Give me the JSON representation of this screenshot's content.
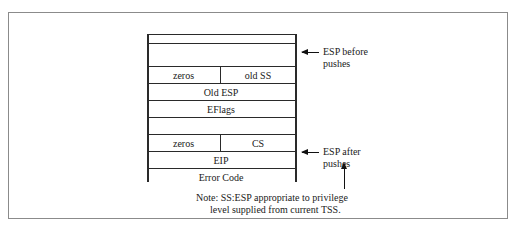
{
  "figure": {
    "type": "stack-layout-diagram",
    "top_caption_sliver": "",
    "stack": {
      "rows": [
        {
          "id": "row-empty-top",
          "cells": [
            {
              "label": ""
            }
          ]
        },
        {
          "id": "row-ss",
          "cells": [
            {
              "label": "zeros"
            },
            {
              "label": "old SS"
            }
          ]
        },
        {
          "id": "row-old-esp",
          "cells": [
            {
              "label": "Old ESP"
            }
          ]
        },
        {
          "id": "row-eflags",
          "cells": [
            {
              "label": "EFlags"
            }
          ]
        },
        {
          "id": "row-cs",
          "cells": [
            {
              "label": "zeros"
            },
            {
              "label": "CS"
            }
          ]
        },
        {
          "id": "row-eip",
          "cells": [
            {
              "label": "EIP"
            }
          ]
        },
        {
          "id": "row-error-code",
          "cells": [
            {
              "label": "Error Code"
            }
          ]
        },
        {
          "id": "row-empty-bottom",
          "cells": [
            {
              "label": ""
            }
          ]
        }
      ]
    },
    "annotations": [
      {
        "id": "esp-before",
        "line1": "ESP before",
        "line2": "pushes"
      },
      {
        "id": "esp-after",
        "line1": "ESP after",
        "line2": "pushes"
      }
    ],
    "note": {
      "line1": "Note: SS:ESP appropriate to privilege",
      "line2": "level supplied from current TSS."
    },
    "colors": {
      "frame_border": "#8b8b8b",
      "stack_line": "#2a2a2a",
      "arrow": "#111111",
      "text": "#1a1a1a",
      "background": "#ffffff"
    }
  }
}
